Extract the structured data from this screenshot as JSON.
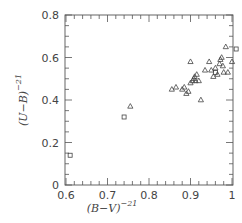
{
  "chart_data": {
    "type": "scatter",
    "title": "",
    "xlabel": "(B−V)",
    "xlabel_superscript": "−21",
    "ylabel": "(U−B)",
    "ylabel_superscript": "−21",
    "xlim": [
      0.6,
      1.01
    ],
    "ylim": [
      0,
      0.8
    ],
    "xticks": [
      0.6,
      0.7,
      0.8,
      0.9,
      1.0
    ],
    "xtick_labels": [
      "0.6",
      "0.7",
      "0.8",
      "0.9",
      "1"
    ],
    "yticks": [
      0,
      0.2,
      0.4,
      0.6,
      0.8
    ],
    "ytick_labels": [
      "0",
      "0.2",
      "0.4",
      "0.6",
      "0.8"
    ],
    "grid": false,
    "legend": null,
    "series": [
      {
        "name": "squares",
        "marker": "square",
        "points": [
          {
            "x": 0.61,
            "y": 0.14
          },
          {
            "x": 0.74,
            "y": 0.32
          },
          {
            "x": 0.96,
            "y": 0.53
          },
          {
            "x": 1.01,
            "y": 0.64
          }
        ]
      },
      {
        "name": "triangles",
        "marker": "triangle",
        "points": [
          {
            "x": 0.755,
            "y": 0.37
          },
          {
            "x": 0.855,
            "y": 0.45
          },
          {
            "x": 0.865,
            "y": 0.46
          },
          {
            "x": 0.88,
            "y": 0.45
          },
          {
            "x": 0.885,
            "y": 0.46
          },
          {
            "x": 0.89,
            "y": 0.43
          },
          {
            "x": 0.895,
            "y": 0.44
          },
          {
            "x": 0.9,
            "y": 0.48
          },
          {
            "x": 0.905,
            "y": 0.49
          },
          {
            "x": 0.908,
            "y": 0.5
          },
          {
            "x": 0.91,
            "y": 0.51
          },
          {
            "x": 0.912,
            "y": 0.49
          },
          {
            "x": 0.915,
            "y": 0.52
          },
          {
            "x": 0.92,
            "y": 0.49
          },
          {
            "x": 0.925,
            "y": 0.4
          },
          {
            "x": 0.935,
            "y": 0.54
          },
          {
            "x": 0.945,
            "y": 0.58
          },
          {
            "x": 0.95,
            "y": 0.54
          },
          {
            "x": 0.96,
            "y": 0.55
          },
          {
            "x": 0.965,
            "y": 0.52
          },
          {
            "x": 0.97,
            "y": 0.57
          },
          {
            "x": 0.972,
            "y": 0.59
          },
          {
            "x": 0.975,
            "y": 0.6
          },
          {
            "x": 0.978,
            "y": 0.56
          },
          {
            "x": 0.985,
            "y": 0.65
          },
          {
            "x": 0.9,
            "y": 0.58
          },
          {
            "x": 0.98,
            "y": 0.53
          },
          {
            "x": 0.99,
            "y": 0.53
          },
          {
            "x": 1.0,
            "y": 0.58
          },
          {
            "x": 0.955,
            "y": 0.51
          }
        ]
      }
    ]
  }
}
